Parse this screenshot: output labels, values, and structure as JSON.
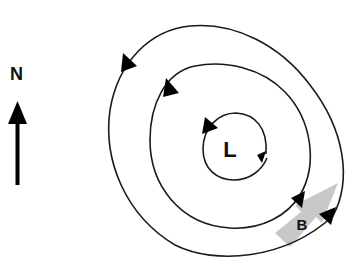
{
  "diagram": {
    "type": "low-pressure cyclonic circulation",
    "north_label": "N",
    "center_label": "L",
    "point_label": "B",
    "colors": {
      "line": "#1a1a1a",
      "arrowhead": "#000000",
      "wind_arrow": "#c8c8c8",
      "background": "#ffffff"
    },
    "rings": [
      {
        "name": "inner",
        "direction": "counterclockwise"
      },
      {
        "name": "middle",
        "direction": "counterclockwise"
      },
      {
        "name": "outer",
        "direction": "counterclockwise"
      }
    ]
  }
}
